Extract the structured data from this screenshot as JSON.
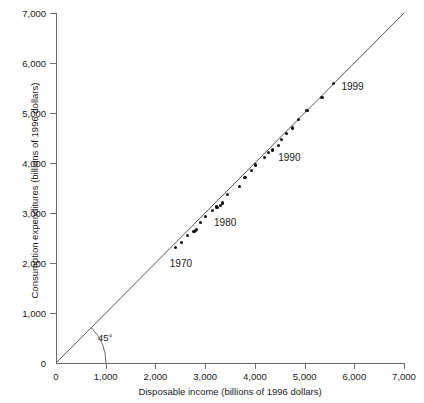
{
  "chart_data": {
    "type": "scatter",
    "title": "",
    "xlabel": "Disposable income (billions of 1996 dollars)",
    "ylabel": "Consumption expenditures (billions of 1996 dollars)",
    "xlim": [
      0,
      7000
    ],
    "ylim": [
      0,
      7000
    ],
    "xticks": [
      "0",
      "1,000",
      "2,000",
      "3,000",
      "4,000",
      "5,000",
      "6,000",
      "7,000"
    ],
    "xtick_values": [
      0,
      1000,
      2000,
      3000,
      4000,
      5000,
      6000,
      7000
    ],
    "yticks": [
      "0",
      "1,000",
      "2,000",
      "3,000",
      "4,000",
      "5,000",
      "6,000",
      "7,000"
    ],
    "ytick_values": [
      0,
      1000,
      2000,
      3000,
      4000,
      5000,
      6000,
      7000
    ],
    "grid": false,
    "legend": null,
    "reference_line": {
      "label": "45°",
      "from": [
        0,
        0
      ],
      "to": [
        7000,
        7000
      ],
      "color": "#555555"
    },
    "series": [
      {
        "name": "Consumption vs disposable income, 1970–1999",
        "color": "#111111",
        "points": [
          {
            "year": 1970,
            "x": 2410,
            "y": 2317
          },
          {
            "year": 1971,
            "x": 2520,
            "y": 2405
          },
          {
            "year": 1972,
            "x": 2640,
            "y": 2551
          },
          {
            "year": 1973,
            "x": 2805,
            "y": 2652
          },
          {
            "year": 1974,
            "x": 2775,
            "y": 2629
          },
          {
            "year": 1975,
            "x": 2820,
            "y": 2677
          },
          {
            "year": 1976,
            "x": 2910,
            "y": 2806
          },
          {
            "year": 1977,
            "x": 3000,
            "y": 2930
          },
          {
            "year": 1978,
            "x": 3150,
            "y": 3053
          },
          {
            "year": 1979,
            "x": 3225,
            "y": 3128
          },
          {
            "year": 1980,
            "x": 3240,
            "y": 3110
          },
          {
            "year": 1981,
            "x": 3315,
            "y": 3147
          },
          {
            "year": 1982,
            "x": 3355,
            "y": 3200
          },
          {
            "year": 1983,
            "x": 3450,
            "y": 3373
          },
          {
            "year": 1984,
            "x": 3695,
            "y": 3523
          },
          {
            "year": 1985,
            "x": 3800,
            "y": 3705
          },
          {
            "year": 1986,
            "x": 3940,
            "y": 3856
          },
          {
            "year": 1987,
            "x": 4010,
            "y": 3960
          },
          {
            "year": 1988,
            "x": 4190,
            "y": 4116
          },
          {
            "year": 1989,
            "x": 4280,
            "y": 4210
          },
          {
            "year": 1990,
            "x": 4350,
            "y": 4271
          },
          {
            "year": 1991,
            "x": 4355,
            "y": 4242
          },
          {
            "year": 1992,
            "x": 4470,
            "y": 4349
          },
          {
            "year": 1993,
            "x": 4530,
            "y": 4463
          },
          {
            "year": 1994,
            "x": 4640,
            "y": 4585
          },
          {
            "year": 1995,
            "x": 4750,
            "y": 4700
          },
          {
            "year": 1996,
            "x": 4870,
            "y": 4870
          },
          {
            "year": 1997,
            "x": 5050,
            "y": 5045
          },
          {
            "year": 1998,
            "x": 5350,
            "y": 5315
          },
          {
            "year": 1999,
            "x": 5580,
            "y": 5585
          }
        ]
      }
    ],
    "annotations": [
      {
        "text": "1970",
        "point_year": 1970
      },
      {
        "text": "1980",
        "point_year": 1980
      },
      {
        "text": "1990",
        "point_year": 1990
      },
      {
        "text": "1999",
        "point_year": 1999
      }
    ]
  },
  "labels": {
    "angle": "45°",
    "a1970": "1970",
    "a1980": "1980",
    "a1990": "1990",
    "a1999": "1999"
  }
}
